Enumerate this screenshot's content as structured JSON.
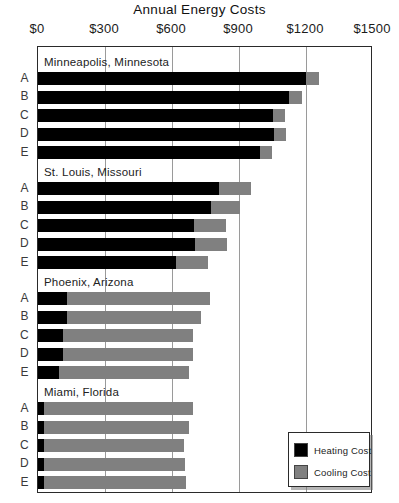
{
  "chart_data": {
    "type": "bar",
    "orientation": "horizontal",
    "stacked": true,
    "title": "Annual Energy Costs",
    "xlabel": "",
    "ylabel": "",
    "xlim": [
      0,
      1500
    ],
    "xticks": [
      0,
      300,
      600,
      900,
      1200,
      1500
    ],
    "xtick_labels": [
      "$0",
      "$300",
      "$600",
      "$900",
      "$1200",
      "$1500"
    ],
    "grid": true,
    "legend_position": "bottom-right",
    "series": [
      {
        "name": "Heating Cost",
        "color": "#000000"
      },
      {
        "name": "Cooling Cost",
        "color": "#808080"
      }
    ],
    "row_labels": [
      "A",
      "B",
      "C",
      "D",
      "E"
    ],
    "groups": [
      {
        "name": "Minneapolis, Minnesota",
        "rows": [
          {
            "label": "A",
            "heating": 1200,
            "cooling": 58,
            "total": 1258
          },
          {
            "label": "B",
            "heating": 1125,
            "cooling": 55,
            "total": 1180
          },
          {
            "label": "C",
            "heating": 1050,
            "cooling": 55,
            "total": 1105
          },
          {
            "label": "D",
            "heating": 1055,
            "cooling": 55,
            "total": 1110
          },
          {
            "label": "E",
            "heating": 995,
            "cooling": 55,
            "total": 1050
          }
        ]
      },
      {
        "name": "St. Louis, Missouri",
        "rows": [
          {
            "label": "A",
            "heating": 810,
            "cooling": 143,
            "total": 953
          },
          {
            "label": "B",
            "heating": 775,
            "cooling": 130,
            "total": 905
          },
          {
            "label": "C",
            "heating": 700,
            "cooling": 140,
            "total": 840
          },
          {
            "label": "D",
            "heating": 705,
            "cooling": 140,
            "total": 845
          },
          {
            "label": "E",
            "heating": 620,
            "cooling": 140,
            "total": 760
          }
        ]
      },
      {
        "name": "Phoenix, Arizona",
        "rows": [
          {
            "label": "A",
            "heating": 130,
            "cooling": 640,
            "total": 770
          },
          {
            "label": "B",
            "heating": 130,
            "cooling": 600,
            "total": 730
          },
          {
            "label": "C",
            "heating": 112,
            "cooling": 582,
            "total": 694
          },
          {
            "label": "D",
            "heating": 112,
            "cooling": 582,
            "total": 694
          },
          {
            "label": "E",
            "heating": 94,
            "cooling": 582,
            "total": 676
          }
        ]
      },
      {
        "name": "Miami, Florida",
        "rows": [
          {
            "label": "A",
            "heating": 25,
            "cooling": 669,
            "total": 694
          },
          {
            "label": "B",
            "heating": 25,
            "cooling": 651,
            "total": 676
          },
          {
            "label": "C",
            "heating": 25,
            "cooling": 628,
            "total": 653
          },
          {
            "label": "D",
            "heating": 25,
            "cooling": 633,
            "total": 658
          },
          {
            "label": "E",
            "heating": 25,
            "cooling": 637,
            "total": 662
          }
        ]
      }
    ]
  }
}
